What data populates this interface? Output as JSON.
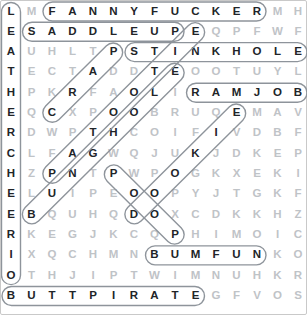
{
  "app": {
    "name": "word-search-puzzle"
  },
  "colors": {
    "background": "#ffffff",
    "border": "#c9c9c9",
    "letter_default": "#bfc3c7",
    "letter_found": "#212428",
    "oval_stroke": "#8e949b"
  },
  "puzzle": {
    "rows": 15,
    "cols": 15,
    "grid": [
      "LMFANNYFUCKERMH",
      "ESADDLEUPEQPFWF",
      "AUHLTPSTINKHOLE",
      "TECTADDTEOOTUYL",
      "HPKRFAOLIRAMJOB",
      "EQCXPOOBRUQEMAV",
      "RDWPTHCOIFIVDBF",
      "CLFAGWQJUKJDKEP",
      "HZPNTPWPOGKXEKI",
      "ELUIPEOOPYJTGKF",
      "EBQUHQDOXCDKKHZ",
      "RKEGJKCQPHIMOIC",
      "IXQCHMNBUMFUNKO",
      "OTHJIPTWIMNUHKR",
      "BUTTPIRATEGFVOS"
    ],
    "found_words": [
      {
        "word": "FANNYFUCKER",
        "start_row": 0,
        "start_col": 2,
        "end_row": 0,
        "end_col": 12
      },
      {
        "word": "SADDLEUP",
        "start_row": 1,
        "start_col": 1,
        "end_row": 1,
        "end_col": 8
      },
      {
        "word": "STINKHOLE",
        "start_row": 2,
        "start_col": 6,
        "end_row": 2,
        "end_col": 14
      },
      {
        "word": "RAMJOB",
        "start_row": 4,
        "start_col": 9,
        "end_row": 4,
        "end_col": 14
      },
      {
        "word": "BUMFUN",
        "start_row": 12,
        "start_col": 7,
        "end_row": 12,
        "end_col": 12
      },
      {
        "word": "BUTTPIRATE",
        "start_row": 14,
        "start_col": 0,
        "end_row": 14,
        "end_col": 9
      },
      {
        "word": "LEATHERCHEERIO",
        "start_row": 0,
        "start_col": 0,
        "end_row": 13,
        "end_col": 0
      },
      {
        "word": "PATOOTIE",
        "start_row": 8,
        "start_col": 2,
        "end_row": 1,
        "end_col": 9
      },
      {
        "word": "CRAP",
        "start_row": 5,
        "start_col": 2,
        "end_row": 2,
        "end_col": 5
      },
      {
        "word": "BUNGHOLE",
        "start_row": 10,
        "start_col": 1,
        "end_row": 3,
        "end_col": 8
      },
      {
        "word": "POOP",
        "start_row": 8,
        "start_col": 5,
        "end_row": 11,
        "end_col": 8
      },
      {
        "word": "DOOKIE",
        "start_row": 10,
        "start_col": 6,
        "end_row": 5,
        "end_col": 11
      }
    ]
  }
}
